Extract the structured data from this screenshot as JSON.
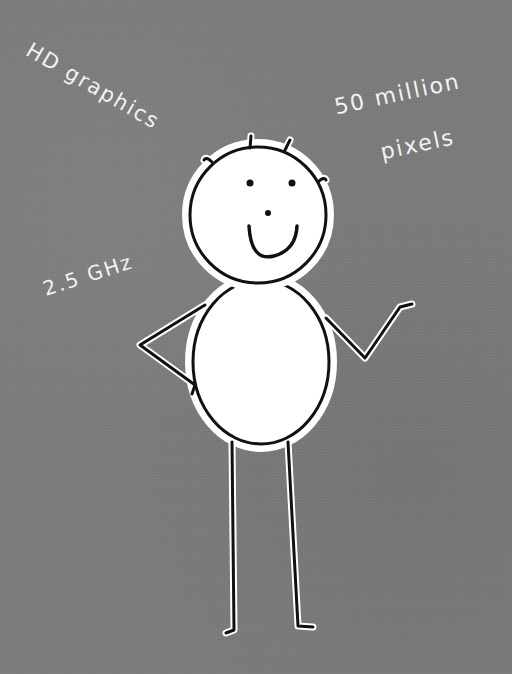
{
  "illustration": {
    "subject": "smiling stick figure with round head and oval body",
    "background_color": "#7b7b7b",
    "outline_color": "#111111",
    "fill_color": "#ffffff",
    "text_color": "#f2f2f2"
  },
  "labels": {
    "hd_graphics": "HD graphics",
    "pixels_line1": "50 million",
    "pixels_line2": "pixels",
    "clock_speed": "2.5 GHz"
  }
}
